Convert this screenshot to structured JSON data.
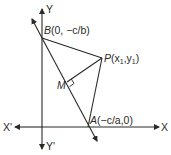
{
  "diagram": {
    "type": "coordinate-geometry",
    "axes": {
      "x_positive": "X",
      "x_negative": "X'",
      "y_positive": "Y",
      "y_negative": "Y'"
    },
    "points": {
      "B": {
        "name": "B",
        "coords": "(0, −c/b)"
      },
      "P": {
        "name": "P",
        "coords_prefix": "(x",
        "sub1": "1",
        "mid": ",y",
        "sub2": "1",
        "coords_suffix": ")"
      },
      "A": {
        "name": "A",
        "coords": "(−c/a,0)"
      },
      "M": {
        "name": "M"
      }
    },
    "segments": [
      "BP",
      "PA",
      "PM",
      "BA (line extended)"
    ],
    "right_angle_at": "M"
  }
}
